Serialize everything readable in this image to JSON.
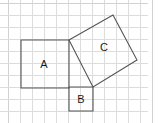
{
  "figure": {
    "width": 159,
    "height": 123,
    "background_color": "#ffffff"
  },
  "grid": {
    "cell_size": 12,
    "line_color": "#dcdcdc",
    "border_color": "#d2d2d2",
    "x_start": 8,
    "y_start": 3,
    "x_end": 148,
    "y_end": 123,
    "columns": 12,
    "rows": 10
  },
  "shapes": [
    {
      "id": "square-a",
      "label": "A",
      "kind": "square",
      "orientation": "axis-aligned",
      "side_cells": 4,
      "side_px": 48,
      "area_cells": 16,
      "points": "21,40 69,40 69,88 21,88",
      "label_x": 44,
      "label_y": 64,
      "stroke_color": "#555555"
    },
    {
      "id": "square-b",
      "label": "B",
      "kind": "square",
      "orientation": "axis-aligned",
      "side_cells": 2,
      "side_px": 24,
      "area_cells": 4,
      "points": "69,87 93,87 93,111 69,111",
      "label_x": 81,
      "label_y": 99,
      "stroke_color": "#555555"
    },
    {
      "id": "square-c",
      "label": "C",
      "kind": "square",
      "orientation": "tilted",
      "side_cells": 4.47,
      "side_px": 53.7,
      "area_cells": 20,
      "points": "69,40 113,15 137,60 93,87",
      "label_x": 104,
      "label_y": 47,
      "stroke_color": "#555555"
    }
  ],
  "labels": {
    "a": "A",
    "b": "B",
    "c": "C"
  }
}
